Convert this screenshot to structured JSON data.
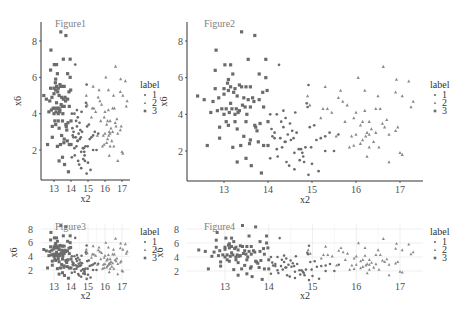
{
  "colors": {
    "point_dark": "#6b6b6b",
    "point_tri": "#8a8a8a",
    "axis": "#333333",
    "tick_text": "#4d4d4d",
    "title_text": "#808080",
    "grid": "#ebebeb"
  },
  "legend": {
    "title": "label",
    "items": [
      {
        "label": "1",
        "shape": "circle"
      },
      {
        "label": "2",
        "shape": "triangle"
      },
      {
        "label": "3",
        "shape": "square"
      }
    ]
  },
  "chart_data": [
    {
      "type": "scatter",
      "title": "Figure1",
      "xlabel": "x2",
      "ylabel": "x6",
      "xticks": [
        13,
        14,
        15,
        16,
        17
      ],
      "yticks": [
        2,
        4,
        6,
        8
      ],
      "xlim": [
        12.3,
        17.4
      ],
      "ylim": [
        0.6,
        8.7
      ],
      "grid": false,
      "legend_position": "right",
      "panel": {
        "x0": 41,
        "x1": 130,
        "y0": 22,
        "y1": 180,
        "px13": 54,
        "px17": 122,
        "py2": 150,
        "py8": 41,
        "legend_x": 140,
        "legend_y": 88
      }
    },
    {
      "type": "scatter",
      "title": "Figure2",
      "xlabel": "x2",
      "ylabel": "x6",
      "xticks": [
        13,
        14,
        15,
        16,
        17
      ],
      "yticks": [
        2,
        4,
        6,
        8
      ],
      "xlim": [
        12.3,
        17.4
      ],
      "ylim": [
        0.6,
        8.7
      ],
      "grid": false,
      "legend_position": "right",
      "panel": {
        "x0": 187,
        "x1": 423,
        "y0": 22,
        "y1": 181,
        "px13": 224,
        "px17": 400,
        "py2": 151,
        "py8": 41,
        "legend_x": 430,
        "legend_y": 88
      }
    },
    {
      "type": "scatter",
      "title": "Figure3",
      "xlabel": "x2",
      "ylabel": "x6",
      "xticks": [
        13,
        14,
        15,
        16,
        17
      ],
      "yticks": [
        2,
        4,
        6,
        8
      ],
      "xlim": [
        12.3,
        17.4
      ],
      "ylim": [
        0.6,
        8.7
      ],
      "grid": true,
      "legend_position": "right",
      "panel": {
        "x0": 41,
        "x1": 130,
        "y0": 224,
        "y1": 281,
        "px13": 54,
        "px17": 122,
        "py2": 270,
        "py8": 229,
        "legend_x": 140,
        "legend_y": 235
      }
    },
    {
      "type": "scatter",
      "title": "Figure4",
      "xlabel": "x2",
      "ylabel": "x6",
      "xticks": [
        13,
        14,
        15,
        16,
        17
      ],
      "yticks": [
        2,
        4,
        6,
        8
      ],
      "xlim": [
        12.3,
        17.4
      ],
      "ylim": [
        0.6,
        8.7
      ],
      "grid": true,
      "legend_position": "right",
      "panel": {
        "x0": 187,
        "x1": 423,
        "y0": 224,
        "y1": 281,
        "px13": 225,
        "px17": 400,
        "py2": 271,
        "py8": 229,
        "legend_x": 430,
        "legend_y": 235
      }
    }
  ],
  "points": {
    "label_3": [
      [
        12.4,
        5.0
      ],
      [
        12.55,
        4.8
      ],
      [
        12.62,
        2.3
      ],
      [
        12.7,
        4.1
      ],
      [
        12.75,
        4.7
      ],
      [
        12.8,
        6.4
      ],
      [
        12.8,
        5.4
      ],
      [
        12.82,
        7.5
      ],
      [
        12.85,
        4.2
      ],
      [
        12.88,
        4.9
      ],
      [
        12.9,
        3.3
      ],
      [
        12.9,
        2.7
      ],
      [
        12.95,
        4.3
      ],
      [
        13.0,
        5.4
      ],
      [
        13.0,
        5.1
      ],
      [
        13.0,
        4.0
      ],
      [
        13.02,
        6.7
      ],
      [
        13.05,
        4.3
      ],
      [
        13.05,
        3.6
      ],
      [
        13.08,
        5.7
      ],
      [
        13.1,
        5.9
      ],
      [
        13.1,
        5.3
      ],
      [
        13.1,
        3.4
      ],
      [
        13.12,
        4.1
      ],
      [
        13.15,
        6.7
      ],
      [
        13.15,
        5.5
      ],
      [
        13.18,
        4.3
      ],
      [
        13.2,
        6.2
      ],
      [
        13.2,
        2.2
      ],
      [
        13.22,
        5.2
      ],
      [
        13.25,
        5.4
      ],
      [
        13.25,
        3.6
      ],
      [
        13.28,
        4.3
      ],
      [
        13.3,
        5.0
      ],
      [
        13.3,
        3.2
      ],
      [
        13.3,
        1.4
      ],
      [
        13.32,
        4.1
      ],
      [
        13.35,
        5.6
      ],
      [
        13.35,
        4.2
      ],
      [
        13.38,
        2.3
      ],
      [
        13.4,
        8.5
      ],
      [
        13.4,
        5.5
      ],
      [
        13.42,
        4.5
      ],
      [
        13.45,
        4.9
      ],
      [
        13.45,
        2.8
      ],
      [
        13.48,
        4.4
      ],
      [
        13.5,
        5.5
      ],
      [
        13.5,
        3.6
      ],
      [
        13.5,
        1.6
      ],
      [
        13.52,
        4.0
      ],
      [
        13.55,
        7.0
      ],
      [
        13.55,
        4.8
      ],
      [
        13.58,
        2.4
      ],
      [
        13.6,
        5.5
      ],
      [
        13.6,
        4.4
      ],
      [
        13.62,
        1.2
      ],
      [
        13.65,
        4.9
      ],
      [
        13.68,
        4.7
      ],
      [
        13.7,
        8.3
      ],
      [
        13.72,
        3.3
      ],
      [
        13.75,
        3.1
      ],
      [
        13.78,
        2.5
      ],
      [
        13.8,
        6.2
      ],
      [
        13.8,
        4.8
      ],
      [
        13.82,
        3.5
      ],
      [
        13.85,
        0.8
      ],
      [
        13.88,
        5.2
      ],
      [
        13.9,
        4.4
      ],
      [
        13.9,
        2.3
      ],
      [
        13.95,
        7.0
      ],
      [
        13.95,
        6.0
      ],
      [
        13.98,
        5.3
      ],
      [
        14.0,
        2.3
      ],
      [
        14.0,
        3.6
      ],
      [
        13.7,
        3.4
      ],
      [
        13.6,
        2.6
      ],
      [
        13.25,
        4.0
      ],
      [
        13.15,
        4.6
      ]
    ],
    "label_1": [
      [
        14.05,
        4.0
      ],
      [
        14.05,
        1.6
      ],
      [
        14.08,
        3.2
      ],
      [
        14.1,
        2.8
      ],
      [
        14.15,
        2.7
      ],
      [
        14.2,
        4.0
      ],
      [
        14.2,
        2.1
      ],
      [
        14.22,
        1.7
      ],
      [
        14.25,
        6.7
      ],
      [
        14.28,
        2.7
      ],
      [
        14.3,
        3.6
      ],
      [
        14.32,
        2.2
      ],
      [
        14.35,
        4.2
      ],
      [
        14.35,
        3.3
      ],
      [
        14.38,
        2.5
      ],
      [
        14.4,
        3.8
      ],
      [
        14.42,
        1.4
      ],
      [
        14.45,
        2.9
      ],
      [
        14.48,
        1.2
      ],
      [
        14.5,
        3.5
      ],
      [
        14.52,
        2.6
      ],
      [
        14.55,
        3.1
      ],
      [
        14.58,
        2.7
      ],
      [
        14.6,
        1.0
      ],
      [
        14.62,
        4.1
      ],
      [
        14.65,
        3.0
      ],
      [
        14.7,
        2.1
      ],
      [
        14.72,
        1.5
      ],
      [
        14.75,
        2.1
      ],
      [
        14.78,
        1.9
      ],
      [
        14.8,
        1.7
      ],
      [
        14.82,
        1.4
      ],
      [
        14.85,
        2.2
      ],
      [
        14.88,
        4.6
      ],
      [
        14.9,
        4.4
      ],
      [
        14.92,
        5.6
      ],
      [
        14.92,
        0.7
      ],
      [
        14.95,
        3.3
      ],
      [
        14.98,
        2.2
      ],
      [
        15.0,
        1.3
      ],
      [
        15.05,
        3.4
      ],
      [
        15.1,
        2.6
      ],
      [
        15.15,
        0.9
      ],
      [
        15.2,
        2.7
      ],
      [
        15.3,
        2.0
      ],
      [
        15.3,
        2.8
      ],
      [
        15.4,
        3.0
      ],
      [
        15.5,
        2.0
      ],
      [
        15.6,
        2.9
      ],
      [
        14.15,
        3.0
      ],
      [
        14.6,
        1.9
      ],
      [
        14.4,
        2.5
      ]
    ],
    "label_2": [
      [
        14.9,
        5.0
      ],
      [
        14.95,
        4.5
      ],
      [
        15.2,
        3.8
      ],
      [
        15.25,
        4.3
      ],
      [
        15.3,
        5.5
      ],
      [
        15.35,
        4.3
      ],
      [
        15.45,
        4.1
      ],
      [
        15.55,
        2.8
      ],
      [
        15.6,
        4.9
      ],
      [
        15.65,
        5.3
      ],
      [
        15.7,
        4.7
      ],
      [
        15.75,
        3.6
      ],
      [
        15.8,
        4.5
      ],
      [
        15.85,
        2.2
      ],
      [
        15.9,
        2.8
      ],
      [
        15.95,
        3.8
      ],
      [
        16.0,
        4.1
      ],
      [
        16.0,
        2.9
      ],
      [
        16.05,
        6.0
      ],
      [
        16.1,
        3.4
      ],
      [
        16.1,
        2.4
      ],
      [
        16.15,
        3.6
      ],
      [
        16.2,
        5.3
      ],
      [
        16.2,
        4.2
      ],
      [
        16.22,
        2.8
      ],
      [
        16.25,
        3.0
      ],
      [
        16.25,
        1.7
      ],
      [
        16.3,
        3.6
      ],
      [
        16.3,
        2.2
      ],
      [
        16.35,
        3.2
      ],
      [
        16.4,
        2.5
      ],
      [
        16.45,
        4.3
      ],
      [
        16.45,
        3.0
      ],
      [
        16.5,
        5.0
      ],
      [
        16.52,
        2.2
      ],
      [
        16.55,
        4.3
      ],
      [
        16.6,
        3.5
      ],
      [
        16.62,
        6.6
      ],
      [
        16.65,
        3.3
      ],
      [
        16.7,
        3.7
      ],
      [
        16.75,
        2.9
      ],
      [
        16.75,
        1.4
      ],
      [
        16.9,
        5.2
      ],
      [
        16.9,
        3.1
      ],
      [
        16.92,
        5.9
      ],
      [
        16.95,
        3.3
      ],
      [
        17.0,
        1.9
      ],
      [
        17.05,
        5.0
      ],
      [
        17.05,
        1.8
      ],
      [
        17.2,
        5.8
      ],
      [
        17.25,
        4.4
      ],
      [
        17.3,
        4.7
      ],
      [
        16.3,
        2.9
      ],
      [
        16.15,
        2.6
      ],
      [
        15.95,
        2.3
      ]
    ]
  }
}
